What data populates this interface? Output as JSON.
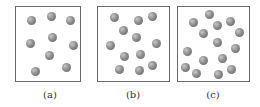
{
  "panels": [
    {
      "id": "a",
      "label": "(a)",
      "left": 15,
      "width": 66,
      "label_center": 50,
      "particles": [
        [
          31,
          20
        ],
        [
          51,
          16
        ],
        [
          70,
          20
        ],
        [
          52,
          37
        ],
        [
          30,
          43
        ],
        [
          73,
          45
        ],
        [
          49,
          55
        ],
        [
          35,
          71
        ],
        [
          66,
          67
        ]
      ]
    },
    {
      "id": "b",
      "label": "(b)",
      "left": 97,
      "width": 73,
      "label_center": 133,
      "particles": [
        [
          114,
          17
        ],
        [
          138,
          20
        ],
        [
          152,
          16
        ],
        [
          123,
          30
        ],
        [
          136,
          37
        ],
        [
          110,
          45
        ],
        [
          156,
          43
        ],
        [
          124,
          56
        ],
        [
          140,
          54
        ],
        [
          119,
          69
        ],
        [
          139,
          70
        ],
        [
          152,
          65
        ]
      ]
    },
    {
      "id": "c",
      "label": "(c)",
      "left": 177,
      "width": 73,
      "label_center": 213,
      "particles": [
        [
          209,
          14
        ],
        [
          193,
          22
        ],
        [
          217,
          25
        ],
        [
          230,
          21
        ],
        [
          203,
          33
        ],
        [
          239,
          32
        ],
        [
          217,
          42
        ],
        [
          235,
          48
        ],
        [
          187,
          51
        ],
        [
          203,
          60
        ],
        [
          222,
          58
        ],
        [
          185,
          67
        ],
        [
          196,
          73
        ],
        [
          218,
          74
        ],
        [
          231,
          69
        ]
      ]
    }
  ],
  "colors": {
    "border": "#6a6a6a",
    "sphere": "#8e8e8e",
    "label": "#333333"
  }
}
